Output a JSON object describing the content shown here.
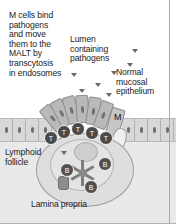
{
  "figure": {
    "background_color": "#ffffff",
    "tissue_color": "#e9e9e9",
    "cell_color": "#4a4a4a"
  },
  "labels": {
    "m_cell_caption": "M cells bind\npathogens\nand move\nthem to the\nMALT by\ntranscytosis\nin endosomes",
    "lumen": "Lumen\ncontaining\npathogens",
    "normal_epithelium": "Normal\nmucosal\nepithelium",
    "lymphoid_follicle": "Lymphoid\nfollicle",
    "lamina_propria": "Lamina propria",
    "m_cell_tag": "M"
  },
  "cells": {
    "t_cell_label": "T",
    "b_cell_label": "B",
    "t_cells": [
      {
        "x": 44,
        "y": 131
      },
      {
        "x": 57,
        "y": 125
      },
      {
        "x": 71,
        "y": 122
      },
      {
        "x": 85,
        "y": 126
      },
      {
        "x": 99,
        "y": 131
      }
    ],
    "b_cells": [
      {
        "x": 60,
        "y": 163
      },
      {
        "x": 98,
        "y": 157
      },
      {
        "x": 84,
        "y": 180
      }
    ]
  },
  "dome_epithelium": [
    {
      "x": 46,
      "y": 104,
      "rot": -40
    },
    {
      "x": 55,
      "y": 99,
      "rot": -28
    },
    {
      "x": 65,
      "y": 96,
      "rot": -16
    },
    {
      "x": 76,
      "y": 95,
      "rot": -4
    },
    {
      "x": 87,
      "y": 97,
      "rot": 8
    },
    {
      "x": 97,
      "y": 101,
      "rot": 20
    }
  ],
  "epithelial_cells": {
    "left_count": 4,
    "right_count": 4
  },
  "pathogens": [
    {
      "x": 132,
      "y": 49
    },
    {
      "x": 127,
      "y": 63
    },
    {
      "x": 111,
      "y": 71
    },
    {
      "x": 71,
      "y": 73
    },
    {
      "x": 95,
      "y": 83
    },
    {
      "x": 79,
      "y": 89
    },
    {
      "x": 106,
      "y": 93
    },
    {
      "x": 61,
      "y": 151
    }
  ]
}
